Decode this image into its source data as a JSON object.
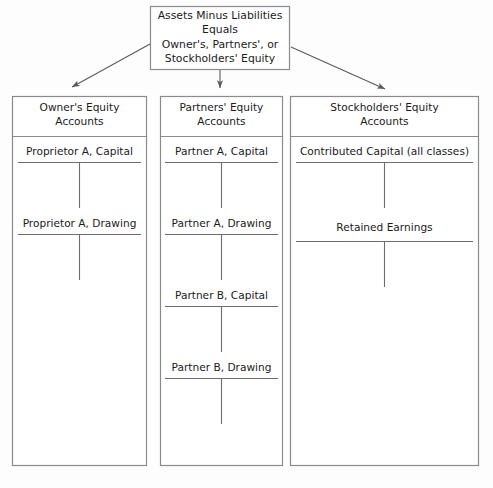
{
  "diagram": {
    "type": "accounting-equity-accounts-hierarchy",
    "background_color": "#fdfdfd",
    "line_color": "#8b8b8b",
    "text_color": "#1b1b1b",
    "root": {
      "lines": [
        "Assets Minus Liabilities",
        "Equals",
        "Owner's, Partners', or",
        "Stockholders' Equity"
      ]
    },
    "arrows": [
      {
        "name": "arrow-to-owners-equity",
        "direction": "down-left"
      },
      {
        "name": "arrow-to-partners-equity",
        "direction": "down"
      },
      {
        "name": "arrow-to-stockholders-equity",
        "direction": "down-right"
      }
    ],
    "columns": [
      {
        "id": "owners-equity",
        "header_lines": [
          "Owner's Equity",
          "Accounts"
        ],
        "accounts": [
          "Proprietor A, Capital",
          "Proprietor A, Drawing"
        ]
      },
      {
        "id": "partners-equity",
        "header_lines": [
          "Partners' Equity",
          "Accounts"
        ],
        "accounts": [
          "Partner A, Capital",
          "Partner A, Drawing",
          "Partner B, Capital",
          "Partner B, Drawing"
        ]
      },
      {
        "id": "stockholders-equity",
        "header_lines": [
          "Stockholders' Equity",
          "Accounts"
        ],
        "accounts": [
          "Contributed Capital (all classes)",
          "Retained Earnings"
        ]
      }
    ]
  }
}
